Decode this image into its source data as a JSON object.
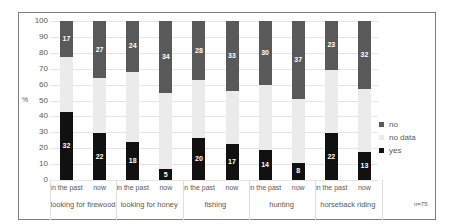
{
  "chart_data": {
    "type": "bar",
    "stacked": true,
    "title": "",
    "xlabel": "",
    "ylabel": "%",
    "ylim": [
      0,
      100
    ],
    "yticks": [
      0,
      10,
      20,
      30,
      40,
      50,
      60,
      70,
      80,
      90,
      100
    ],
    "grid": true,
    "legend_position": "right",
    "note": "n=75",
    "groups": [
      "looking for firewood",
      "looking for honey",
      "fishing",
      "hunting",
      "horseback riding"
    ],
    "categories": [
      "in the past",
      "now",
      "in the past",
      "now",
      "in the past",
      "now",
      "in the past",
      "now",
      "in the past",
      "now"
    ],
    "series": [
      {
        "name": "yes",
        "color": "#111111",
        "counts": [
          32,
          22,
          18,
          5,
          20,
          17,
          14,
          8,
          22,
          13
        ],
        "values": [
          42.7,
          29.3,
          24.0,
          6.7,
          26.7,
          22.7,
          18.7,
          10.7,
          29.3,
          17.3
        ]
      },
      {
        "name": "no data",
        "color": "#ebebeb",
        "counts": [
          26,
          26,
          33,
          36,
          27,
          25,
          31,
          30,
          30,
          30
        ],
        "values": [
          34.7,
          34.7,
          44.0,
          48.0,
          36.0,
          33.3,
          41.3,
          40.0,
          40.0,
          40.0
        ]
      },
      {
        "name": "no",
        "color": "#595959",
        "counts": [
          17,
          27,
          24,
          34,
          28,
          33,
          30,
          37,
          23,
          32
        ],
        "values": [
          22.7,
          36.0,
          32.0,
          45.3,
          37.3,
          44.0,
          40.0,
          49.3,
          30.7,
          42.7
        ]
      }
    ]
  },
  "legend": [
    "no",
    "no data",
    "yes"
  ],
  "ylabel": "%",
  "note": "n=75"
}
